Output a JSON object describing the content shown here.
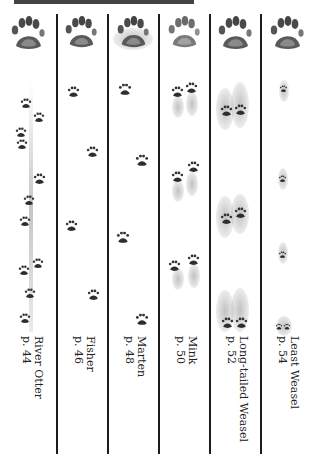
{
  "page": {
    "header_fragment": "(cropped title text)"
  },
  "columns": [
    {
      "id": "river-otter",
      "name": "River Otter",
      "page": "p. 44"
    },
    {
      "id": "fisher",
      "name": "Fisher",
      "page": "p. 46"
    },
    {
      "id": "marten",
      "name": "Marten",
      "page": "p. 48"
    },
    {
      "id": "mink",
      "name": "Mink",
      "page": "p. 50"
    },
    {
      "id": "long-tailed-weasel",
      "name": "Long-tailed Weasel",
      "page": "p. 52"
    },
    {
      "id": "least-weasel",
      "name": "Least Weasel",
      "page": "p. 54"
    }
  ],
  "colors": {
    "ink": "#222222",
    "divider": "#1c1c1c",
    "track_dark": "#3a3a3a",
    "track_mid": "#7a7a7a",
    "background": "#ffffff"
  }
}
